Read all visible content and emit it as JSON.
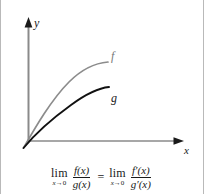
{
  "figure": {
    "background": "#ffffff",
    "border_color": "#b9b9b9"
  },
  "axes": {
    "y_label": "y",
    "x_label": "x",
    "color": "#8a8a8a",
    "arrow_color": "#1a1a1a"
  },
  "curves": [
    {
      "name": "f",
      "label": "f",
      "color": "#8c8c8c",
      "description": "concave increasing curve from origin, upper curve"
    },
    {
      "name": "g",
      "label": "g",
      "color": "#111111",
      "description": "concave increasing curve from origin, lower curve"
    }
  ],
  "formula": {
    "left": {
      "lim": "lim",
      "sub_var": "x",
      "sub_arrow": "→",
      "sub_target": "0",
      "numerator": "f(x)",
      "denominator": "g(x)"
    },
    "equals": "=",
    "right": {
      "lim": "lim",
      "sub_var": "x",
      "sub_arrow": "→",
      "sub_target": "0",
      "numerator": "f′(x)",
      "denominator": "g′(x)"
    }
  }
}
